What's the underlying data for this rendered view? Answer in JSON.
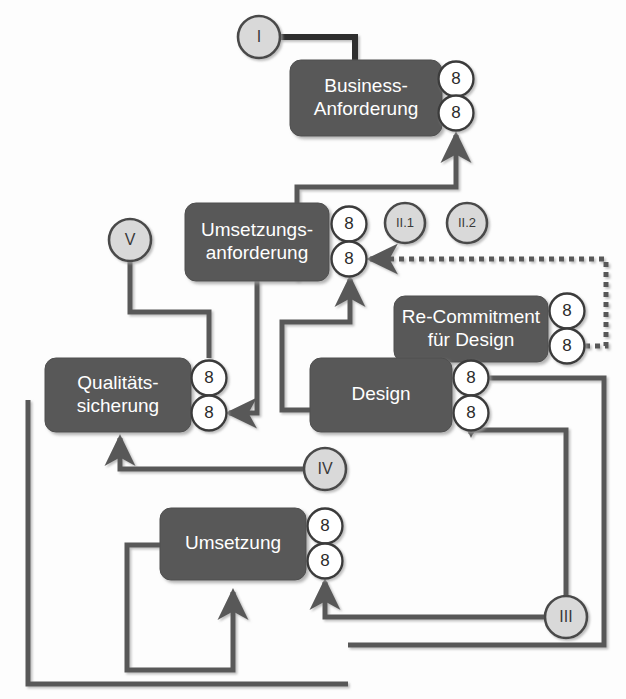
{
  "diagram": {
    "colors": {
      "box_fill": "#585858",
      "box_text": "#ffffff",
      "badge_fill": "#ffffff",
      "badge_stroke": "#3a3a3a",
      "badge_text": "#2b2b2b",
      "marker_fill": "#d9d9d9",
      "marker_stroke": "#4a4a4a",
      "connector": "#595959",
      "connector_strong": "#2f2f2f",
      "background": "#fdfdfd"
    },
    "boxes": [
      {
        "id": "business",
        "label_line1": "Business-",
        "label_line2": "Anforderung",
        "x": 290,
        "y": 60,
        "w": 152,
        "h": 76
      },
      {
        "id": "umsetzungsanforderung",
        "label_line1": "Umsetzungs-",
        "label_line2": "anforderung",
        "x": 185,
        "y": 203,
        "w": 144,
        "h": 78
      },
      {
        "id": "recommitment",
        "label_line1": "Re-Commitment",
        "label_line2": "für Design",
        "x": 394,
        "y": 296,
        "w": 154,
        "h": 66
      },
      {
        "id": "design",
        "label_line1": "Design",
        "label_line2": "",
        "x": 310,
        "y": 358,
        "w": 142,
        "h": 74
      },
      {
        "id": "qualitaetssicherung",
        "label_line1": "Qualitäts-",
        "label_line2": "sicherung",
        "x": 45,
        "y": 358,
        "w": 146,
        "h": 74
      },
      {
        "id": "umsetzung",
        "label_line1": "Umsetzung",
        "label_line2": "",
        "x": 160,
        "y": 508,
        "w": 146,
        "h": 72
      }
    ],
    "badges": [
      {
        "id": "business-badge-top",
        "value": "8",
        "cx": 456,
        "cy": 79
      },
      {
        "id": "business-badge-bottom",
        "value": "8",
        "cx": 456,
        "cy": 113
      },
      {
        "id": "umsetzungsanforderung-badge-top",
        "value": "8",
        "cx": 349,
        "cy": 224
      },
      {
        "id": "umsetzungsanforderung-badge-bottom",
        "value": "8",
        "cx": 349,
        "cy": 259
      },
      {
        "id": "recommitment-badge-top",
        "value": "8",
        "cx": 567,
        "cy": 311
      },
      {
        "id": "recommitment-badge-bottom",
        "value": "8",
        "cx": 567,
        "cy": 346
      },
      {
        "id": "design-badge-top",
        "value": "8",
        "cx": 471,
        "cy": 378
      },
      {
        "id": "design-badge-bottom",
        "value": "8",
        "cx": 471,
        "cy": 413
      },
      {
        "id": "qualitaetssicherung-badge-top",
        "value": "8",
        "cx": 209,
        "cy": 378
      },
      {
        "id": "qualitaetssicherung-badge-bottom",
        "value": "8",
        "cx": 209,
        "cy": 413
      },
      {
        "id": "umsetzung-badge-top",
        "value": "8",
        "cx": 325,
        "cy": 526
      },
      {
        "id": "umsetzung-badge-bottom",
        "value": "8",
        "cx": 325,
        "cy": 561
      }
    ],
    "markers": [
      {
        "id": "marker-i",
        "label": "I",
        "cx": 259,
        "cy": 37,
        "r": 21,
        "small": false
      },
      {
        "id": "marker-v",
        "label": "V",
        "cx": 130,
        "cy": 240,
        "r": 21,
        "small": false
      },
      {
        "id": "marker-ii-1",
        "label": "II.1",
        "cx": 405,
        "cy": 223,
        "r": 20,
        "small": true
      },
      {
        "id": "marker-ii-2",
        "label": "II.2",
        "cx": 467,
        "cy": 223,
        "r": 20,
        "small": true
      },
      {
        "id": "marker-iv",
        "label": "IV",
        "cx": 325,
        "cy": 469,
        "r": 21,
        "small": false
      },
      {
        "id": "marker-iii",
        "label": "III",
        "cx": 566,
        "cy": 617,
        "r": 21,
        "small": false
      }
    ],
    "connectors": [
      {
        "id": "conn-i-to-business",
        "style": "strong",
        "arrow": "none",
        "path": "M 280 37 L 355 37 L 355 60"
      },
      {
        "id": "conn-i-to-umsetzungsanforderung",
        "style": "strong",
        "arrow": "end",
        "path": "M 259 58 L 259 196"
      },
      {
        "id": "conn-v-to-umsetzungsanforderung",
        "style": "normal",
        "arrow": "end",
        "path": "M 151 240 L 178 240"
      },
      {
        "id": "conn-v-to-qualitaetssicherung",
        "style": "normal",
        "arrow": "none",
        "path": "M 130 261 L 130 312 L 209 312 L 209 358"
      },
      {
        "id": "conn-umsetzungsanforderung-to-business",
        "style": "normal",
        "arrow": "end",
        "path": "M 297 281 L 297 187 L 456 187 L 456 135"
      },
      {
        "id": "conn-umsetzungsanforderung-to-ii1",
        "style": "normal",
        "arrow": "none",
        "path": "M 367 224 L 386 224"
      },
      {
        "id": "conn-ii1-to-ii2",
        "style": "dashed",
        "arrow": "none",
        "path": "M 425 223 L 447 223"
      },
      {
        "id": "conn-ii1-to-design",
        "style": "normal",
        "arrow": "end",
        "path": "M 405 243 L 405 352"
      },
      {
        "id": "conn-ii2-to-recommitment",
        "style": "dashed",
        "arrow": "end",
        "path": "M 467 243 L 467 290"
      },
      {
        "id": "conn-recommitment-to-umsetzungsanforderung",
        "style": "dashed",
        "arrow": "end",
        "path": "M 585 346 L 606 346 L 606 259 L 370 259"
      },
      {
        "id": "conn-design-to-umsetzungsanforderung",
        "style": "normal",
        "arrow": "end",
        "path": "M 310 410 L 282 410 L 282 322 L 350 322 L 350 279"
      },
      {
        "id": "conn-umsetzungsanforderung-to-qualitaetssicherung",
        "style": "normal",
        "arrow": "end",
        "path": "M 257 281 L 257 413 L 229 413"
      },
      {
        "id": "conn-design-badge-to-umsetzung-loop",
        "style": "normal",
        "arrow": "none",
        "path": "M 489 378 L 604 378 L 604 645 L 348 645"
      },
      {
        "id": "conn-iv-to-qualitaetssicherung",
        "style": "normal",
        "arrow": "end",
        "path": "M 304 469 L 120 469 L 120 438"
      },
      {
        "id": "conn-iv-to-umsetzung-badge",
        "style": "normal",
        "arrow": "none",
        "path": "M 325 490 L 325 508"
      },
      {
        "id": "conn-iii-to-umsetzung",
        "style": "normal",
        "arrow": "end",
        "path": "M 545 617 L 325 617 L 325 582"
      },
      {
        "id": "conn-iii-to-design-badge",
        "style": "normal",
        "arrow": "end",
        "path": "M 566 596 L 566 430 L 471 430 L 471 434"
      },
      {
        "id": "conn-umsetzung-loop-left",
        "style": "normal",
        "arrow": "end",
        "path": "M 160 545 L 127 545 L 127 670 L 233 670 L 233 600 L 233 592"
      },
      {
        "id": "conn-qualitaetssicherung-bottom-loop",
        "style": "normal",
        "arrow": "none",
        "path": "M 28 400 L 28 684 L 348 684"
      }
    ]
  }
}
